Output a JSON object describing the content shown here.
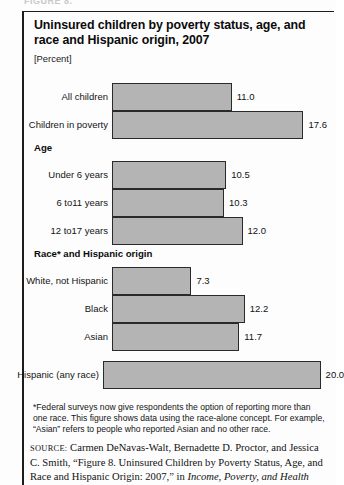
{
  "figure": {
    "cut_header": "FIGURE 8.",
    "title": "Uninsured children by poverty status, age, and race and Hispanic origin, 2007",
    "units_label": "[Percent]"
  },
  "footnote": {
    "text": "*Federal surveys now give respondents the option of reporting more than one race. This figure shows data using the race-alone concept. For example, “Asian” refers to people who reported Asian and no other race."
  },
  "source": {
    "prefix": "source:",
    "line1": " Carmen DeNavas-Walt, Bernadette D. Proctor, and Jessica",
    "line2": "C. Smith, “Figure 8. Uninsured Children by Poverty Status, Age, and",
    "line3_pre": "Race and Hispanic Origin: 2007,” in ",
    "line3_italic": "Income, Poverty, and Health"
  },
  "chart_data": {
    "type": "bar",
    "orientation": "horizontal",
    "title": "Uninsured children by poverty status, age, and race and Hispanic origin, 2007",
    "xlabel": "Percent",
    "ylabel": "",
    "xlim": [
      0,
      20
    ],
    "grid": false,
    "legend": "none",
    "bar_color": "#b4b4b4",
    "bar_border_color": "#2a2a2a",
    "groups": [
      {
        "heading": "",
        "bars": [
          {
            "category": "All children",
            "value": 11.0,
            "label": "11.0"
          },
          {
            "category": "Children in poverty",
            "value": 17.6,
            "label": "17.6"
          }
        ]
      },
      {
        "heading": "Age",
        "bars": [
          {
            "category": "Under 6 years",
            "value": 10.5,
            "label": "10.5"
          },
          {
            "category": "6 to11 years",
            "value": 10.3,
            "label": "10.3"
          },
          {
            "category": "12 to17 years",
            "value": 12.0,
            "label": "12.0"
          }
        ]
      },
      {
        "heading": "Race* and Hispanic origin",
        "bars": [
          {
            "category": "White, not Hispanic",
            "value": 7.3,
            "label": "7.3"
          },
          {
            "category": "Black",
            "value": 12.2,
            "label": "12.2"
          },
          {
            "category": "Asian",
            "value": 11.7,
            "label": "11.7"
          },
          {
            "category": "Hispanic (any race)",
            "value": 20.0,
            "label": "20.0"
          }
        ]
      }
    ],
    "categories": [
      "All children",
      "Children in poverty",
      "Under 6 years",
      "6 to11 years",
      "12 to17 years",
      "White, not Hispanic",
      "Black",
      "Asian",
      "Hispanic (any race)"
    ],
    "values": [
      11.0,
      17.6,
      10.5,
      10.3,
      12.0,
      7.3,
      12.2,
      11.7,
      20.0
    ]
  }
}
